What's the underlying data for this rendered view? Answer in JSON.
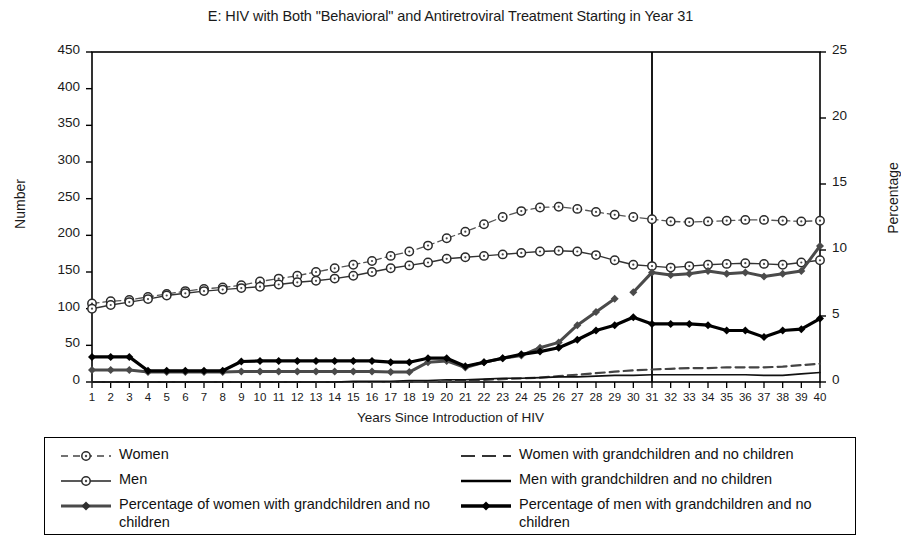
{
  "chart_data": {
    "type": "line",
    "title": "E: HIV with Both \"Behavioral\" and Antiretroviral Treatment Starting in Year 31",
    "xlabel": "Years Since Introduction of HIV",
    "ylabel": "Number",
    "ylabel_right": "Percentage",
    "xlim": [
      1,
      40
    ],
    "ylim": [
      0,
      450
    ],
    "ylim_right": [
      0,
      25
    ],
    "yticks": [
      0,
      50,
      100,
      150,
      200,
      250,
      300,
      350,
      400,
      450
    ],
    "yticks_right": [
      0,
      5,
      10,
      15,
      20,
      25
    ],
    "x": [
      1,
      2,
      3,
      4,
      5,
      6,
      7,
      8,
      9,
      10,
      11,
      12,
      13,
      14,
      15,
      16,
      17,
      18,
      19,
      20,
      21,
      22,
      23,
      24,
      25,
      26,
      27,
      28,
      29,
      30,
      31,
      32,
      33,
      34,
      35,
      36,
      37,
      38,
      39,
      40
    ],
    "xticks": [
      "1",
      "2",
      "3",
      "4",
      "5",
      "6",
      "7",
      "8",
      "9",
      "10",
      "11",
      "12",
      "13",
      "14",
      "15",
      "16",
      "17",
      "18",
      "19",
      "20",
      "21",
      "22",
      "23",
      "24",
      "25",
      "26",
      "27",
      "28",
      "29",
      "30",
      "31",
      "32",
      "33",
      "34",
      "35",
      "36",
      "37",
      "38",
      "39",
      "40"
    ],
    "grid": false,
    "legend_position": "below",
    "annotations": [
      {
        "type": "vline",
        "x": 31,
        "label": "Treatment starting in Year 31"
      }
    ],
    "series": [
      {
        "name": "Women",
        "axis": "left",
        "style": "dashed",
        "marker": "open-circle",
        "color": "#555555",
        "values": [
          107,
          110,
          112,
          116,
          120,
          124,
          127,
          129,
          132,
          137,
          141,
          145,
          150,
          155,
          160,
          165,
          172,
          178,
          186,
          196,
          205,
          215,
          225,
          233,
          238,
          239,
          236,
          232,
          228,
          225,
          222,
          219,
          218,
          219,
          220,
          221,
          221,
          220,
          219,
          220
        ]
      },
      {
        "name": "Men",
        "axis": "left",
        "style": "solid",
        "marker": "open-circle",
        "color": "#333333",
        "values": [
          100,
          105,
          109,
          113,
          118,
          121,
          124,
          126,
          128,
          130,
          133,
          136,
          138,
          141,
          145,
          150,
          155,
          159,
          163,
          168,
          170,
          172,
          174,
          176,
          178,
          179,
          178,
          173,
          166,
          160,
          158,
          156,
          158,
          160,
          161,
          162,
          161,
          160,
          163,
          166
        ]
      },
      {
        "name": "Percentage of women with grandchildren and no children",
        "axis": "right",
        "style": "solid-thick-gray",
        "marker": "filled-diamond",
        "color": "#555555",
        "gap_after": 29,
        "values": [
          0.9,
          0.9,
          0.9,
          0.75,
          0.75,
          0.75,
          0.75,
          0.75,
          0.8,
          0.8,
          0.8,
          0.8,
          0.8,
          0.8,
          0.8,
          0.8,
          0.75,
          0.75,
          1.5,
          1.6,
          1.1,
          1.5,
          1.8,
          2.0,
          2.6,
          3.0,
          4.3,
          5.3,
          6.3,
          6.8,
          8.3,
          8.1,
          8.2,
          8.4,
          8.2,
          8.3,
          8.0,
          8.2,
          8.4,
          10.3
        ]
      },
      {
        "name": "Percentage of men with grandchildren and no children",
        "axis": "right",
        "style": "solid-thick-black",
        "marker": "filled-diamond",
        "color": "#000000",
        "values": [
          1.9,
          1.9,
          1.9,
          0.85,
          0.85,
          0.85,
          0.85,
          0.85,
          1.55,
          1.6,
          1.6,
          1.6,
          1.6,
          1.6,
          1.6,
          1.6,
          1.5,
          1.5,
          1.8,
          1.8,
          1.2,
          1.5,
          1.8,
          2.1,
          2.3,
          2.6,
          3.2,
          3.9,
          4.3,
          4.9,
          4.4,
          4.4,
          4.4,
          4.3,
          3.9,
          3.9,
          3.4,
          3.9,
          4.0,
          4.8
        ]
      },
      {
        "name": "Women with grandchildren and no children",
        "axis": "left",
        "style": "dashed",
        "marker": "none",
        "color": "#444444",
        "values": [
          0,
          0,
          0,
          0,
          0,
          0,
          0,
          0,
          0,
          0,
          0,
          0,
          0,
          0,
          0,
          0,
          0,
          0,
          0,
          1,
          2,
          3,
          4,
          5,
          6,
          8,
          10,
          12,
          14,
          16,
          17,
          18,
          19,
          19,
          20,
          20,
          20,
          21,
          23,
          25
        ]
      },
      {
        "name": "Men with grandchildren and no children",
        "axis": "left",
        "style": "solid-thin",
        "marker": "none",
        "color": "#111111",
        "values": [
          0,
          0,
          0,
          0,
          0,
          0,
          0,
          0,
          0,
          0,
          0,
          0,
          0,
          0,
          1,
          1,
          1,
          2,
          2,
          3,
          3,
          4,
          5,
          5,
          6,
          7,
          7,
          8,
          9,
          9,
          10,
          10,
          10,
          10,
          10,
          10,
          9,
          9,
          11,
          13
        ]
      }
    ]
  },
  "legend": {
    "entries": [
      {
        "label": "Women",
        "swatch": "dashed-open-circle"
      },
      {
        "label": "Men",
        "swatch": "solid-open-circle"
      },
      {
        "label": "Percentage of women with grandchildren and no children",
        "swatch": "thick-gray-diamond"
      },
      {
        "label": "Women with grandchildren and no children",
        "swatch": "dashed-plain"
      },
      {
        "label": "Men with grandchildren and no children",
        "swatch": "solid-plain"
      },
      {
        "label": "Percentage of men with grandchildren and no children",
        "swatch": "thick-black-diamond"
      }
    ]
  },
  "colors": {
    "axis": "#000000",
    "women": "#555555",
    "men": "#333333",
    "percent_men": "#000000",
    "percent_women": "#555555",
    "background": "#ffffff"
  }
}
